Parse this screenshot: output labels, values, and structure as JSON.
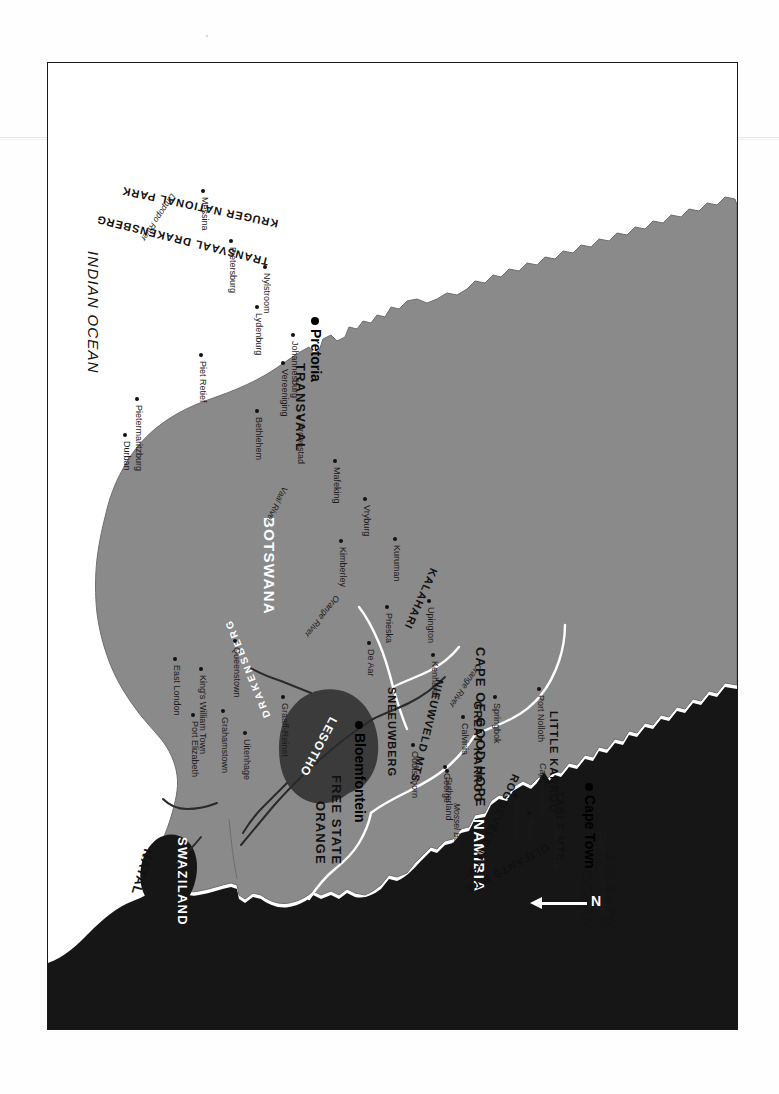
{
  "map": {
    "title": "Southern Africa / Republic of South Africa",
    "orientation_note": "printed upside-down (rotated 180 degrees)",
    "north_arrow_label": "N",
    "colors": {
      "land_south_africa": "#8a8a8a",
      "neighbouring_countries": "#161616",
      "lesotho_highlands": "#3b3b3b",
      "ocean": "#ffffff",
      "border_line": "#ffffff",
      "river_line": "#2a2a2a",
      "frame": "#1a1a1a"
    },
    "countries": [
      {
        "name": "MOZAMBIQUE"
      },
      {
        "name": "ZIMBABWE"
      },
      {
        "name": "BOTSWANA"
      },
      {
        "name": "NAMIBIA"
      },
      {
        "name": "SWAZILAND"
      },
      {
        "name": "LESOTHO"
      }
    ],
    "provinces": [
      {
        "name": "TRANSVAAL"
      },
      {
        "name": "NATAL"
      },
      {
        "name": "ORANGE"
      },
      {
        "name": "FREE STATE"
      },
      {
        "name": "CAPE OF GOOD HOPE"
      }
    ],
    "regions": [
      {
        "name": "KRUGER NATIONAL PARK"
      },
      {
        "name": "TRANSVAAL DRAKENSBERG"
      },
      {
        "name": "DRAKENSBERG"
      },
      {
        "name": "KALAHARI"
      },
      {
        "name": "SNEEUWBERG"
      },
      {
        "name": "NIEUWVELD MTS."
      },
      {
        "name": "GREAT KARROO"
      },
      {
        "name": "LITTLE KARROO"
      },
      {
        "name": "ROGGEVELD MTS."
      },
      {
        "name": "TABLE MTS."
      },
      {
        "name": "OLIFANTS  MTS."
      }
    ],
    "capitals": [
      {
        "name": "Pretoria"
      },
      {
        "name": "Bloemfontein"
      },
      {
        "name": "Cape Town"
      }
    ],
    "cities": [
      {
        "name": "Messina"
      },
      {
        "name": "Pietersburg"
      },
      {
        "name": "Nylstroom"
      },
      {
        "name": "Lydenburg"
      },
      {
        "name": "Johannesburg"
      },
      {
        "name": "Vereeniging"
      },
      {
        "name": "Piet Retief"
      },
      {
        "name": "Pietermaritzburg"
      },
      {
        "name": "Durban"
      },
      {
        "name": "Bethlehem"
      },
      {
        "name": "Kroonstad"
      },
      {
        "name": "Mafeking"
      },
      {
        "name": "Vryburg"
      },
      {
        "name": "Kuruman"
      },
      {
        "name": "Upington"
      },
      {
        "name": "Kimberley"
      },
      {
        "name": "Prieska"
      },
      {
        "name": "De Aar"
      },
      {
        "name": "Queenstown"
      },
      {
        "name": "King's William Town"
      },
      {
        "name": "East London"
      },
      {
        "name": "Grahamstown"
      },
      {
        "name": "Uitenhage"
      },
      {
        "name": "Port Elizabeth"
      },
      {
        "name": "Graaff-Reinet"
      },
      {
        "name": "Oudtshoorn"
      },
      {
        "name": "George"
      },
      {
        "name": "Kenhardt"
      },
      {
        "name": "Springbok"
      },
      {
        "name": "Port Nolloth"
      },
      {
        "name": "Calvinia"
      },
      {
        "name": "Sutherland"
      },
      {
        "name": "Worcester"
      },
      {
        "name": "Paarl"
      }
    ],
    "oceans": [
      {
        "name": "INDIAN OCEAN"
      },
      {
        "name": "ATLANTIC OCEAN"
      }
    ],
    "water_features": [
      {
        "name": "Limpopo  River"
      },
      {
        "name": "Vaal River"
      },
      {
        "name": "Orange River"
      },
      {
        "name": "Orange River"
      },
      {
        "name": "Saldanha Bay"
      },
      {
        "name": "Mossel Bay"
      }
    ],
    "capes": [
      {
        "name": "Cape of Good Hope"
      },
      {
        "name": "Cape Agulhas"
      }
    ]
  },
  "labels": {
    "mozambique": "MOZAMBIQUE",
    "zimbabwe": "ZIMBABWE",
    "botswana": "BOTSWANA",
    "namibia": "NAMIBIA",
    "swaziland": "SWAZILAND",
    "lesotho": "LESOTHO",
    "transvaal": "TRANSVAAL",
    "natal": "NATAL",
    "orange": "ORANGE",
    "free_state": "FREE STATE",
    "cape_of_good_hope": "CAPE OF GOOD HOPE",
    "kruger": "KRUGER NATIONAL PARK",
    "tvl_drakensberg": "TRANSVAAL DRAKENSBERG",
    "drakensberg": "DRAKENSBERG",
    "kalahari": "KALAHARI",
    "sneeuwberg": "SNEEUWBERG",
    "nieuwveld": "NIEUWVELD MTS.",
    "great_karroo": "GREAT  KARROO",
    "little_karroo": "LITTLE  KARROO",
    "roggeveld": "ROGGEVELD MTS.",
    "table_mts": "TABLE MTS.",
    "olifants": "OLIFANTS   MTS.",
    "pretoria": "Pretoria",
    "bloemfontein": "Bloemfontein",
    "cape_town": "Cape Town",
    "messina": "Messina",
    "pietersburg": "Pietersburg",
    "nylstroom": "Nylstroom",
    "lydenburg": "Lydenburg",
    "johannesburg": "Johannesburg",
    "vereeniging": "Vereeniging",
    "piet_retief": "Piet Retief",
    "pietermaritzburg": "Pietermaritzburg",
    "durban": "Durban",
    "bethlehem": "Bethlehem",
    "kroonstad": "Kroonstad",
    "mafeking": "Mafeking",
    "vryburg": "Vryburg",
    "kuruman": "Kuruman",
    "upington": "Upington",
    "kimberley": "Kimberley",
    "prieska": "Prieska",
    "de_aar": "De Aar",
    "queenstown": "Queenstown",
    "kings_william_town": "King's William Town",
    "east_london": "East London",
    "grahamstown": "Grahamstown",
    "uitenhage": "Uitenhage",
    "port_elizabeth": "Port Elizabeth",
    "graaff_reinet": "Graaff-Reinet",
    "oudtshoorn": "Oudtshoorn",
    "george": "George",
    "kenhardt": "Kenhardt",
    "springbok": "Springbok",
    "port_nolloth": "Port Nolloth",
    "calvinia": "Calvinia",
    "sutherland": "Sutherland",
    "worcester": "Worcester",
    "paarl": "Paarl",
    "indian_ocean": "INDIAN OCEAN",
    "atlantic_ocean_1": "ATLANTIC",
    "atlantic_ocean_2": "OCEAN",
    "limpopo_river": "Limpopo   River",
    "vaal_river": "Vaal River",
    "orange_river_e": "Orange River",
    "orange_river_w": "Orange River",
    "saldanha_bay": "Saldanha Bay",
    "mossel_bay": "Mossel Bay",
    "cape_good_hope_pt": "Cape of Good Hope",
    "cape_agulhas": "Cape Agulhas",
    "north": "N"
  }
}
